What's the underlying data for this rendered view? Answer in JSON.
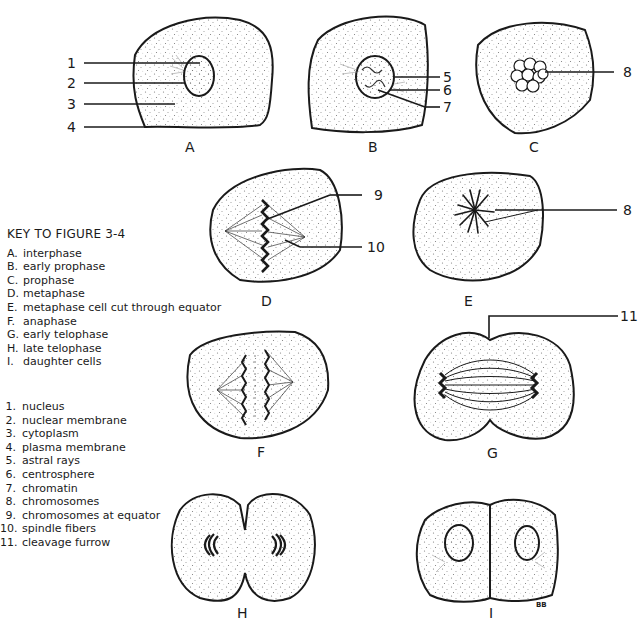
{
  "figure": {
    "key_title": "KEY TO FIGURE 3-4",
    "stages": [
      {
        "letter": "A.",
        "name": "interphase"
      },
      {
        "letter": "B.",
        "name": "early prophase"
      },
      {
        "letter": "C.",
        "name": "prophase"
      },
      {
        "letter": "D.",
        "name": "metaphase"
      },
      {
        "letter": "E.",
        "name": "metaphase cell cut  through equator"
      },
      {
        "letter": "F.",
        "name": "anaphase"
      },
      {
        "letter": "G.",
        "name": "early telophase"
      },
      {
        "letter": "H.",
        "name": "late telophase"
      },
      {
        "letter": "I.",
        "name": "daughter cells"
      }
    ],
    "parts": [
      {
        "num": "1.",
        "name": "nucleus"
      },
      {
        "num": "2.",
        "name": "nuclear membrane"
      },
      {
        "num": "3.",
        "name": "cytoplasm"
      },
      {
        "num": "4.",
        "name": "plasma membrane"
      },
      {
        "num": "5.",
        "name": "astral rays"
      },
      {
        "num": "6.",
        "name": "centrosphere"
      },
      {
        "num": "7.",
        "name": "chromatin"
      },
      {
        "num": "8.",
        "name": "chromosomes"
      },
      {
        "num": "9.",
        "name": "chromosomes at equator"
      },
      {
        "num": "10.",
        "name": "spindle fibers"
      },
      {
        "num": "11.",
        "name": "cleavage furrow"
      }
    ],
    "captions": {
      "A": "A",
      "B": "B",
      "C": "C",
      "D": "D",
      "E": "E",
      "F": "F",
      "G": "G",
      "H": "H",
      "I": "I"
    },
    "callouts": {
      "n1": "1",
      "n2": "2",
      "n3": "3",
      "n4": "4",
      "n5": "5",
      "n6": "6",
      "n7": "7",
      "n8a": "8",
      "n8b": "8",
      "n9": "9",
      "n10": "10",
      "n11": "11"
    },
    "signature": "BB",
    "colors": {
      "ink": "#1a1a1a",
      "background": "#ffffff",
      "stipple": "#6b6b6b"
    }
  }
}
